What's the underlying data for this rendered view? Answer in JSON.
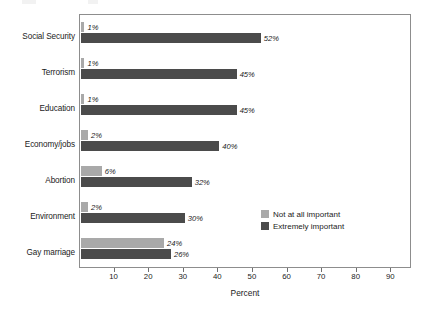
{
  "chart_data": {
    "type": "bar",
    "orientation": "horizontal",
    "title": "",
    "xlabel": "Percent",
    "ylabel": "",
    "xlim": [
      0,
      96
    ],
    "xticks": [
      10,
      20,
      30,
      40,
      50,
      60,
      70,
      80,
      90
    ],
    "xtick_labels": [
      "10",
      "20",
      "30",
      "40",
      "50",
      "60",
      "70",
      "80",
      "90"
    ],
    "grid": false,
    "legend_position": "inside-right-lower",
    "categories": [
      "Social Security",
      "Terrorism",
      "Education",
      "Economy/jobs",
      "Abortion",
      "Environment",
      "Gay marriage"
    ],
    "series": [
      {
        "name": "Not at all important",
        "color": "#a9a9a9",
        "values": [
          1,
          1,
          1,
          2,
          6,
          2,
          24
        ],
        "value_labels": [
          "1%",
          "1%",
          "1%",
          "2%",
          "6%",
          "2%",
          "24%"
        ]
      },
      {
        "name": "Extremely important",
        "color": "#4b4b4b",
        "values": [
          52,
          45,
          45,
          40,
          32,
          30,
          26
        ],
        "value_labels": [
          "52%",
          "45%",
          "45%",
          "40%",
          "32%",
          "30%",
          "26%"
        ]
      }
    ]
  },
  "colors": {
    "not_at_all_important": "#a9a9a9",
    "extremely_important": "#4b4b4b",
    "frame": "#8d8d8d",
    "text": "#1b1b1b",
    "background": "#ffffff"
  }
}
